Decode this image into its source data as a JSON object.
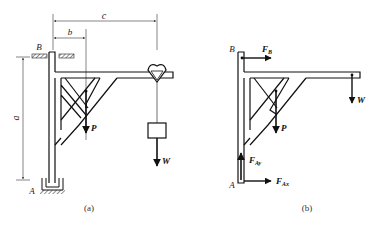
{
  "figure_a": {
    "caption": "(a)",
    "labels": {
      "support_top": "B",
      "support_bottom": "A",
      "dim_b": "b",
      "dim_c": "c",
      "dim_a": "a",
      "load_p": "P",
      "load_w": "W"
    }
  },
  "figure_b": {
    "caption": "(b)",
    "labels": {
      "point_b": "B",
      "point_a": "A",
      "force_fb": "F",
      "force_fb_sub": "B",
      "force_fay": "F",
      "force_fay_sub": "Ay",
      "force_fax": "F",
      "force_fax_sub": "Ax",
      "load_p": "P",
      "load_w": "W"
    }
  }
}
